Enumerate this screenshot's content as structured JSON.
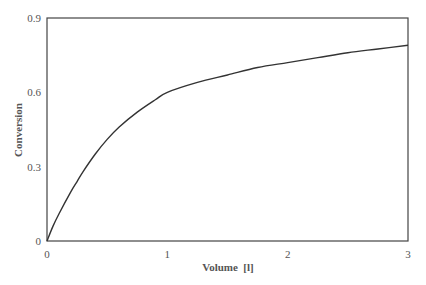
{
  "chart_data": {
    "type": "line",
    "title": "",
    "xlabel": "Volume  [l]",
    "ylabel": "Conversion",
    "xlim": [
      0,
      3
    ],
    "ylim": [
      0,
      0.9
    ],
    "xticks": [
      "0",
      "1",
      "2",
      "3"
    ],
    "yticks": [
      "0",
      "0.3",
      "0.6",
      "0.9"
    ],
    "grid": false,
    "legend": null,
    "series": [
      {
        "name": "Conversion",
        "color": "#333333",
        "x": [
          0,
          0.05,
          0.1,
          0.2,
          0.25,
          0.3,
          0.4,
          0.5,
          0.6,
          0.75,
          0.9,
          1.0,
          1.25,
          1.5,
          1.75,
          2.0,
          2.25,
          2.5,
          2.75,
          3.0
        ],
        "y": [
          0,
          0.06,
          0.11,
          0.2,
          0.24,
          0.28,
          0.35,
          0.41,
          0.46,
          0.52,
          0.57,
          0.6,
          0.64,
          0.67,
          0.7,
          0.72,
          0.74,
          0.76,
          0.775,
          0.79
        ]
      }
    ]
  }
}
